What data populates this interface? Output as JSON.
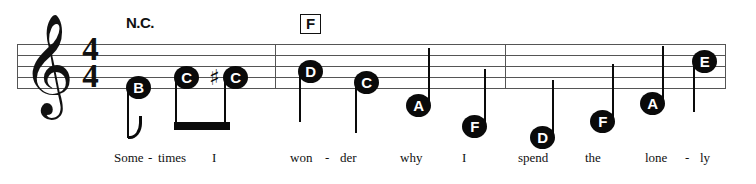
{
  "score": {
    "clef": "treble-clef",
    "clef_glyph": "𝄞",
    "time_signature": {
      "beats": "4",
      "beat_value": "4"
    },
    "chords": [
      {
        "name": "N.C.",
        "boxed": false,
        "x": 126,
        "y": 14
      },
      {
        "name": "F",
        "boxed": true,
        "x": 300,
        "y": 14
      }
    ],
    "barlines": [
      17,
      275,
      505,
      725
    ],
    "staff": {
      "top_line_y": 44,
      "line_spacing": 11,
      "left": 17,
      "right": 726
    },
    "notes": [
      {
        "letter": "B",
        "x": 126,
        "y": 76,
        "stem": "down",
        "flag": true,
        "beamed": false,
        "accidental": ""
      },
      {
        "letter": "C",
        "x": 174,
        "y": 66,
        "stem": "down",
        "flag": false,
        "beamed": true,
        "accidental": ""
      },
      {
        "letter": "C",
        "x": 223,
        "y": 66,
        "stem": "down",
        "flag": false,
        "beamed": true,
        "accidental": "♯"
      },
      {
        "letter": "D",
        "x": 298,
        "y": 60,
        "stem": "down",
        "flag": false,
        "beamed": false,
        "accidental": ""
      },
      {
        "letter": "C",
        "x": 354,
        "y": 71,
        "stem": "down",
        "flag": false,
        "beamed": false,
        "accidental": ""
      },
      {
        "letter": "A",
        "x": 406,
        "y": 94,
        "stem": "up",
        "flag": false,
        "beamed": false,
        "accidental": ""
      },
      {
        "letter": "F",
        "x": 462,
        "y": 115,
        "stem": "up",
        "flag": false,
        "beamed": false,
        "accidental": ""
      },
      {
        "letter": "D",
        "x": 530,
        "y": 126,
        "stem": "up",
        "flag": false,
        "beamed": false,
        "accidental": ""
      },
      {
        "letter": "F",
        "x": 590,
        "y": 110,
        "stem": "up",
        "flag": false,
        "beamed": false,
        "accidental": ""
      },
      {
        "letter": "A",
        "x": 640,
        "y": 92,
        "stem": "up",
        "flag": false,
        "beamed": false,
        "accidental": ""
      },
      {
        "letter": "E",
        "x": 692,
        "y": 50,
        "stem": "down",
        "flag": false,
        "beamed": false,
        "accidental": ""
      }
    ],
    "beam": {
      "x": 174,
      "y": 122,
      "width": 56,
      "height": 8
    },
    "lyrics": [
      {
        "text": "Some",
        "x": 114
      },
      {
        "text": "-",
        "x": 148
      },
      {
        "text": "times",
        "x": 158
      },
      {
        "text": "I",
        "x": 212
      },
      {
        "text": "won",
        "x": 290
      },
      {
        "text": "-",
        "x": 325
      },
      {
        "text": "der",
        "x": 340
      },
      {
        "text": "why",
        "x": 400
      },
      {
        "text": "I",
        "x": 462
      },
      {
        "text": "spend",
        "x": 518
      },
      {
        "text": "the",
        "x": 585
      },
      {
        "text": "lone",
        "x": 645
      },
      {
        "text": "-",
        "x": 685
      },
      {
        "text": "ly",
        "x": 700
      }
    ]
  },
  "colors": {
    "ink": "#111111",
    "staff_line": "#555555",
    "notehead_fill": "#0a0a0a",
    "notehead_text": "#ffffff",
    "background": "#ffffff"
  }
}
